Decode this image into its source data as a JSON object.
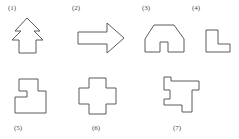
{
  "sheet": {
    "background_color": "#ffffff",
    "stroke_color": "#5b5b5b",
    "label_color": "#4a4a4a",
    "width": 239,
    "height": 139
  },
  "figures": [
    {
      "id": "figure-1",
      "label": "(1)",
      "name": "arrow-tree-shape",
      "description": "upward arrow with two chevron barbs, like a stylized tree",
      "label_x": 8,
      "label_y": 4,
      "points": "27,18 40,31 34,31 43,40 36,40 36,53 19,53 19,40 12,40 21,31 15,31"
    },
    {
      "id": "figure-2",
      "label": "(2)",
      "name": "right-arrow-shape",
      "description": "block arrow pointing right",
      "label_x": 72,
      "label_y": 4,
      "points": "78,32 107,32 107,23 124,38 107,53 107,44 78,44"
    },
    {
      "id": "figure-3",
      "label": "(3)",
      "name": "arch-gate-shape",
      "description": "arch or gateway with rectangular notch in the base",
      "label_x": 142,
      "label_y": 4,
      "points": "145,52 145,39 154,25 174,25 184,39 184,52 168,52 168,42 160,42 160,52"
    },
    {
      "id": "figure-4",
      "label": "(4)",
      "name": "L-corner-shape",
      "description": "L-shaped corner polygon",
      "label_x": 192,
      "label_y": 4,
      "points": "206,30 218,30 218,44 230,44 230,52 206,52"
    },
    {
      "id": "figure-5",
      "label": "(5)",
      "name": "z-step-shape",
      "description": "Z or S shaped staircase polygon",
      "label_x": 14,
      "label_y": 124,
      "points": "19,79 38,79 38,91 46,91 46,113 15,113 15,97 27,97 27,91 19,91"
    },
    {
      "id": "figure-6",
      "label": "(6)",
      "name": "plus-cross-shape",
      "description": "symmetric plus / cross shape",
      "label_x": 92,
      "label_y": 124,
      "points": "89,78 106,78 106,88 116,88 116,104 106,104 106,114 89,114 89,104 79,104 79,88 89,88"
    },
    {
      "id": "figure-7",
      "label": "(7)",
      "name": "notched-square-shape",
      "description": "square with notches cut from the left, right and bottom edges",
      "label_x": 173,
      "label_y": 124,
      "points": "164,77 171,77 171,81 199,81 199,90 192,90 192,112 182,112 182,105 164,105 164,99 170,99 170,90 164,90"
    }
  ]
}
